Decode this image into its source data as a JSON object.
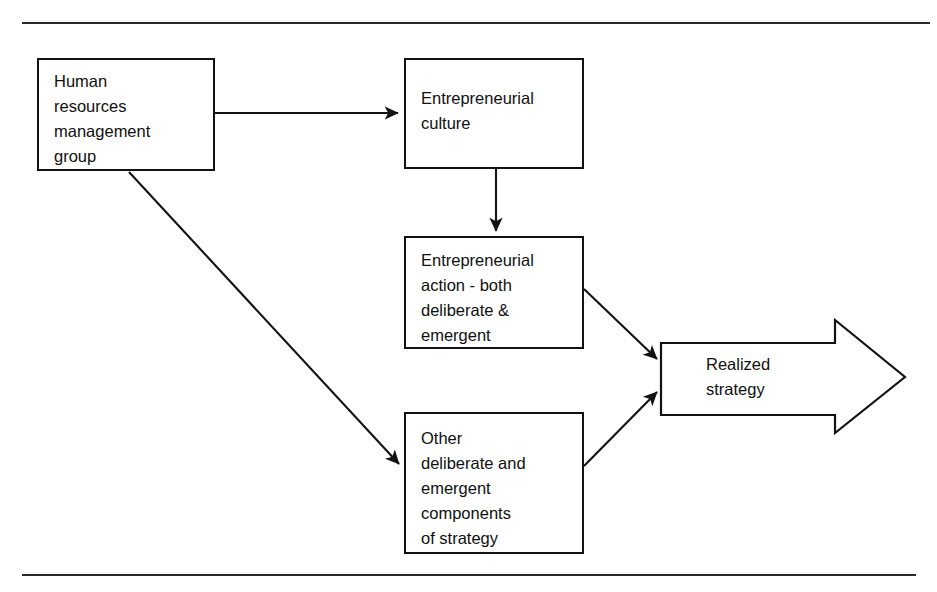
{
  "diagram": {
    "line_color": "#121212",
    "background_color": "#ffffff",
    "text_color": "#101010",
    "nodes": {
      "hr_group": "Human\nresources\nmanagement\ngroup",
      "entrepreneurial_culture": "Entrepreneurial\nculture",
      "entrepreneurial_action": "Entrepreneurial\naction - both\ndeliberate &\nemergent",
      "other_components": "Other\ndeliberate and\nemergent\ncomponents\nof strategy",
      "realized_strategy": "Realized\nstrategy"
    },
    "connectors": [
      {
        "name": "hr-group-to-entrepreneurial-culture",
        "from": "hr_group",
        "to": "entrepreneurial_culture",
        "style": "straight-horizontal"
      },
      {
        "name": "hr-group-to-other-components",
        "from": "hr_group",
        "to": "other_components",
        "style": "diagonal-down-right"
      },
      {
        "name": "entrepreneurial-culture-to-entrepreneurial-action",
        "from": "entrepreneurial_culture",
        "to": "entrepreneurial_action",
        "style": "straight-vertical"
      },
      {
        "name": "entrepreneurial-action-to-realized-strategy",
        "from": "entrepreneurial_action",
        "to": "realized_strategy",
        "style": "diagonal-down-right"
      },
      {
        "name": "other-components-to-realized-strategy",
        "from": "other_components",
        "to": "realized_strategy",
        "style": "diagonal-up-right"
      }
    ],
    "rules": {
      "top": "horizontal-divider-top",
      "bottom": "horizontal-divider-bottom"
    }
  }
}
